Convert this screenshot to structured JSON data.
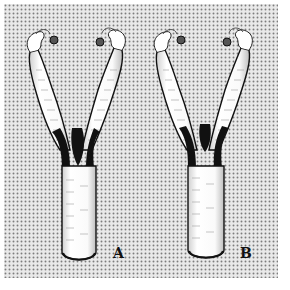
{
  "figure": {
    "background_color": "#ffffff",
    "stipple_color": "#8a8a8a",
    "ink_color": "#111111",
    "fill_color": "#f4f4f4"
  },
  "panels": [
    {
      "id": "A",
      "label": "A"
    },
    {
      "id": "B",
      "label": "B"
    }
  ]
}
